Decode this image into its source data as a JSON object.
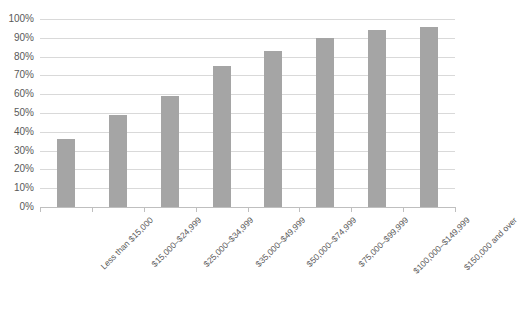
{
  "chart_data": {
    "type": "bar",
    "title": "",
    "xlabel": "",
    "ylabel": "",
    "ylim": [
      0,
      100
    ],
    "grid": true,
    "legend": false,
    "bar_color": "#a5a5a5",
    "gridline_color": "#d9d9d9",
    "axis_color": "#bfbfbf",
    "text_color": "#595959",
    "categories": [
      "Less than $15,000",
      "$15,000–$24,999",
      "$25,000–$34,999",
      "$35,000–$49,999",
      "$50,000–$74,999",
      "$75,000–$99,999",
      "$100,000–$149,999",
      "$150,000 and over"
    ],
    "values": [
      36,
      49,
      59,
      75,
      83,
      90,
      94,
      96
    ],
    "ytick_labels": [
      "100%",
      "90%",
      "80%",
      "70%",
      "60%",
      "50%",
      "40%",
      "30%",
      "20%",
      "10%",
      "0%"
    ],
    "ytick_values": [
      100,
      90,
      80,
      70,
      60,
      50,
      40,
      30,
      20,
      10,
      0
    ]
  }
}
